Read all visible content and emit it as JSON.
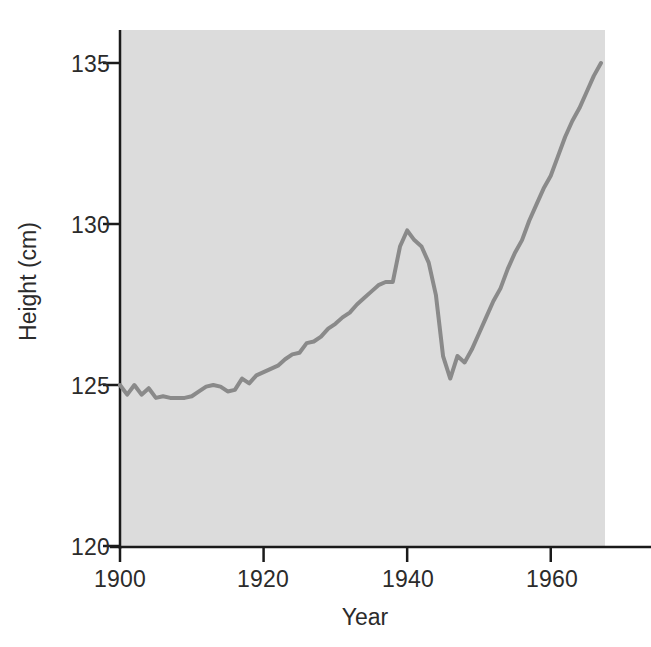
{
  "chart_data": {
    "type": "line",
    "title": "",
    "xlabel": "Year",
    "ylabel": "Height (cm)",
    "xlim": [
      1900,
      1967
    ],
    "ylim": [
      120,
      136.2
    ],
    "xticks": [
      1900,
      1920,
      1940,
      1960
    ],
    "yticks": [
      120,
      125,
      130,
      135
    ],
    "xtick_labels": [
      "1900",
      "1920",
      "1940",
      "1960"
    ],
    "ytick_labels": [
      "120",
      "125",
      "130",
      "135"
    ],
    "grid": false,
    "legend": null,
    "plot_background_color": "#dcdcdc",
    "line_color": "#8a8a8a",
    "axis_color": "#1a1a1a",
    "text_color": "#2b2b2b",
    "series": [
      {
        "name": "Height",
        "x": [
          1900,
          1901,
          1902,
          1903,
          1904,
          1905,
          1906,
          1907,
          1908,
          1909,
          1910,
          1911,
          1912,
          1913,
          1914,
          1915,
          1916,
          1917,
          1918,
          1919,
          1920,
          1921,
          1922,
          1923,
          1924,
          1925,
          1926,
          1927,
          1928,
          1929,
          1930,
          1931,
          1932,
          1933,
          1934,
          1935,
          1936,
          1937,
          1938,
          1939,
          1940,
          1941,
          1942,
          1943,
          1944,
          1945,
          1946,
          1947,
          1948,
          1949,
          1950,
          1951,
          1952,
          1953,
          1954,
          1955,
          1956,
          1957,
          1958,
          1959,
          1960,
          1961,
          1962,
          1963,
          1964,
          1965,
          1966,
          1967
        ],
        "y": [
          125.0,
          124.7,
          125.0,
          124.7,
          124.9,
          124.6,
          124.65,
          124.6,
          124.6,
          124.6,
          124.65,
          124.8,
          124.95,
          125.0,
          124.95,
          124.8,
          124.85,
          125.2,
          125.05,
          125.3,
          125.4,
          125.5,
          125.6,
          125.8,
          125.95,
          126.0,
          126.3,
          126.35,
          126.5,
          126.75,
          126.9,
          127.1,
          127.25,
          127.5,
          127.7,
          127.9,
          128.1,
          128.2,
          128.2,
          129.3,
          129.8,
          129.5,
          129.3,
          128.8,
          127.8,
          125.9,
          125.2,
          125.9,
          125.7,
          126.1,
          126.6,
          127.1,
          127.6,
          128.0,
          128.6,
          129.1,
          129.5,
          130.1,
          130.6,
          131.1,
          131.5,
          132.1,
          132.7,
          133.2,
          133.6,
          134.1,
          134.6,
          135.0
        ]
      }
    ]
  },
  "axes": {
    "ylabel": "Height (cm)",
    "xlabel": "Year"
  }
}
